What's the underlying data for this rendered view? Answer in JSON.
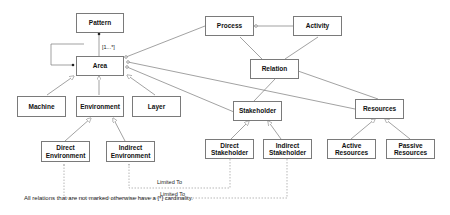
{
  "diagram": {
    "boxes": {
      "pattern": "Pattern",
      "area": "Area",
      "process": "Process",
      "activity": "Activity",
      "relation": "Relation",
      "machine": "Machine",
      "environment": "Environment",
      "layer": "Layer",
      "stakeholder": "Stakeholder",
      "resources": "Resources",
      "direct_environment": "Direct Environment",
      "indirect_environment": "Indirect Environment",
      "direct_stakeholder": "Direct Stakeholder",
      "indirect_stakeholder": "Indirect Stakeholder",
      "active_resources": "Active Resources",
      "passive_resources": "Passive Resources"
    },
    "labels": {
      "cardinality": "[1...*]",
      "limited_to_1": "Limited To",
      "limited_to_2": "Limited To"
    },
    "footnote": "All relations that are not marked otherwise have a  [*] cardinality.",
    "colors": {
      "line": "#7a7a7a",
      "box_border": "#7a7a7a",
      "text": "#111111"
    }
  }
}
